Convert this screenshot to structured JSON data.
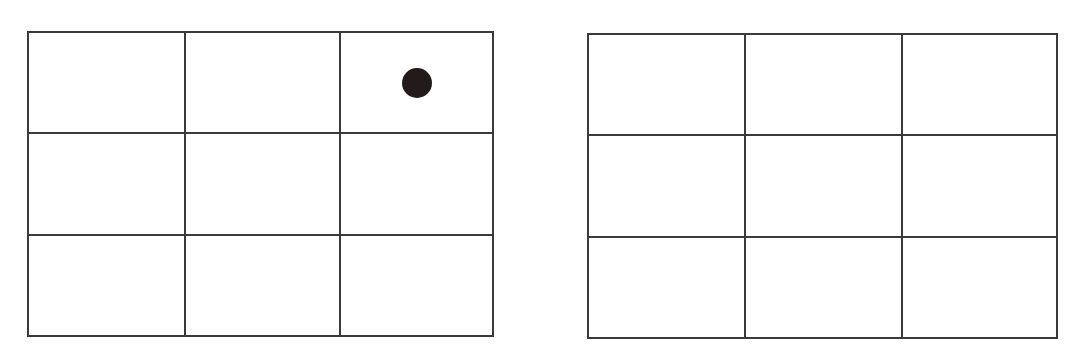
{
  "colors": {
    "line": "#3a3a3a",
    "token": "#231a1a",
    "background": "#ffffff"
  },
  "grids": [
    {
      "id": "left",
      "rows": 3,
      "cols": 3,
      "tokens": [
        {
          "row": 0,
          "col": 2,
          "shape": "filled-circle"
        }
      ]
    },
    {
      "id": "right",
      "rows": 3,
      "cols": 3,
      "tokens": []
    }
  ]
}
